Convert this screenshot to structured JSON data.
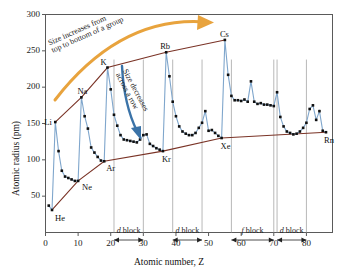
{
  "chart_data": {
    "type": "line",
    "title": "",
    "xlabel": "Atomic number, Z",
    "ylabel": "Atomic radius (pm)",
    "xlim": [
      0,
      88
    ],
    "ylim": [
      0,
      300
    ],
    "xticks": [
      0,
      10,
      20,
      30,
      40,
      50,
      60,
      70,
      80
    ],
    "yticks": [
      50,
      100,
      150,
      200,
      250,
      300
    ],
    "grid": false,
    "legend": "none",
    "series": [
      {
        "name": "Atomic radius",
        "color": "#7fa6cc",
        "x": [
          1,
          2,
          3,
          4,
          5,
          6,
          7,
          8,
          9,
          10,
          11,
          12,
          13,
          14,
          15,
          16,
          17,
          18,
          19,
          20,
          21,
          22,
          23,
          24,
          25,
          26,
          27,
          28,
          29,
          30,
          31,
          32,
          33,
          34,
          35,
          36,
          37,
          38,
          39,
          40,
          41,
          42,
          43,
          44,
          45,
          46,
          47,
          48,
          49,
          50,
          51,
          52,
          53,
          54,
          55,
          56,
          57,
          58,
          59,
          60,
          61,
          62,
          63,
          64,
          65,
          66,
          67,
          68,
          69,
          70,
          71,
          72,
          73,
          74,
          75,
          76,
          77,
          78,
          79,
          80,
          81,
          82,
          83,
          84,
          85,
          86
        ],
        "y": [
          37,
          31,
          152,
          112,
          85,
          77,
          75,
          73,
          71,
          71,
          186,
          160,
          143,
          117,
          110,
          104,
          99,
          98,
          227,
          197,
          162,
          147,
          134,
          128,
          127,
          126,
          125,
          124,
          128,
          134,
          135,
          122,
          119,
          116,
          114,
          112,
          248,
          215,
          180,
          160,
          146,
          139,
          136,
          134,
          134,
          137,
          144,
          151,
          167,
          140,
          141,
          137,
          133,
          130,
          265,
          217,
          188,
          182,
          182,
          181,
          183,
          180,
          208,
          180,
          177,
          178,
          176,
          176,
          175,
          174,
          193,
          159,
          146,
          139,
          137,
          135,
          136,
          139,
          144,
          151,
          170,
          175,
          155,
          167,
          140,
          138
        ]
      }
    ],
    "envelope_upper": {
      "name": "alkali-metal envelope",
      "color": "#7a3326",
      "x": [
        3,
        11,
        19,
        37,
        55
      ],
      "y": [
        152,
        186,
        227,
        248,
        265
      ]
    },
    "envelope_lower": {
      "name": "noble-gas envelope",
      "color": "#7a3326",
      "x": [
        2,
        10,
        18,
        36,
        54,
        86
      ],
      "y": [
        31,
        71,
        98,
        112,
        130,
        138
      ]
    },
    "element_labels": [
      {
        "symbol": "He",
        "z": 2,
        "radius": 31
      },
      {
        "symbol": "Li",
        "z": 3,
        "radius": 152
      },
      {
        "symbol": "Ne",
        "z": 10,
        "radius": 71
      },
      {
        "symbol": "Na",
        "z": 11,
        "radius": 186
      },
      {
        "symbol": "Ar",
        "z": 18,
        "radius": 98
      },
      {
        "symbol": "K",
        "z": 19,
        "radius": 227
      },
      {
        "symbol": "Kr",
        "z": 36,
        "radius": 112
      },
      {
        "symbol": "Rb",
        "z": 37,
        "radius": 248
      },
      {
        "symbol": "Xe",
        "z": 54,
        "radius": 130
      },
      {
        "symbol": "Cs",
        "z": 55,
        "radius": 265
      },
      {
        "symbol": "Rn",
        "z": 86,
        "radius": 138
      }
    ],
    "blocks": [
      {
        "label_prefix": "d",
        "label_suffix": " block",
        "start": 21,
        "end": 30
      },
      {
        "label_prefix": "d",
        "label_suffix": " block",
        "start": 39,
        "end": 48
      },
      {
        "label_prefix": "f",
        "label_suffix": " block",
        "start": 57,
        "end": 70
      },
      {
        "label_prefix": "d",
        "label_suffix": " block",
        "start": 71,
        "end": 80
      }
    ],
    "annotations": [
      {
        "name": "group-trend",
        "line1": "Size increases from",
        "line2": "top to bottom of a group",
        "color": "#e8a33d"
      },
      {
        "name": "period-trend",
        "line1": "Size decreases",
        "line2": "across a row",
        "color": "#3b73a8"
      }
    ],
    "colors": {
      "data_line": "#7fa6cc",
      "marker": "#101010",
      "envelope": "#7a3326",
      "axis": "#5a5a5a",
      "group_arrow": "#e8a33d",
      "row_arrow": "#3b73a8",
      "block_guide": "#9a9a9a"
    }
  }
}
